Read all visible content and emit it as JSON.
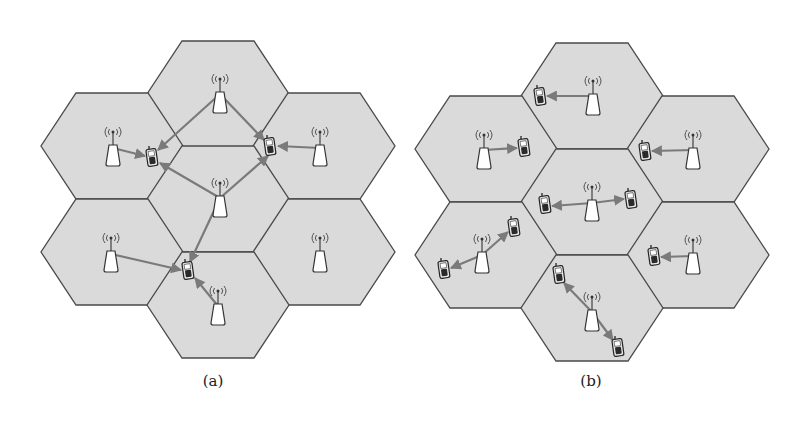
{
  "figure": {
    "colors": {
      "cell_fill": "#dadada",
      "cell_stroke": "#4a4a4a",
      "link": "#7a7a7a",
      "tower_fill": "#ffffff",
      "phone_fill": "#e8e8e8"
    },
    "hex": {
      "half_width": 71,
      "half_height": 53,
      "top_half": 36
    },
    "panels": [
      {
        "id": "a",
        "caption": "(a)",
        "caption_x": 213,
        "cells": [
          {
            "name": "top",
            "cx": 218,
            "cy": 94,
            "tower": [
              220,
              92
            ]
          },
          {
            "name": "upper-left",
            "cx": 112,
            "cy": 146,
            "tower": [
              113,
              145
            ]
          },
          {
            "name": "upper-right",
            "cx": 324,
            "cy": 146,
            "tower": [
              320,
              145
            ]
          },
          {
            "name": "center",
            "cx": 218,
            "cy": 199,
            "tower": [
              220,
              196
            ]
          },
          {
            "name": "lower-left",
            "cx": 112,
            "cy": 252,
            "tower": [
              111,
              251
            ]
          },
          {
            "name": "lower-right",
            "cx": 324,
            "cy": 252,
            "tower": [
              320,
              251
            ]
          },
          {
            "name": "bottom",
            "cx": 218,
            "cy": 305,
            "tower": [
              218,
              304
            ]
          }
        ],
        "phones": [
          {
            "name": "phone-1",
            "x": 152,
            "y": 158
          },
          {
            "name": "phone-2",
            "x": 270,
            "y": 147
          },
          {
            "name": "phone-3",
            "x": 188,
            "y": 271
          }
        ],
        "links": [
          {
            "from": [
              220,
              94
            ],
            "to": [
              158,
              150
            ]
          },
          {
            "from": [
              220,
              94
            ],
            "to": [
              264,
              140
            ]
          },
          {
            "from": [
              113,
              148
            ],
            "to": [
              145,
              156
            ]
          },
          {
            "from": [
              220,
              198
            ],
            "to": [
              160,
              163
            ]
          },
          {
            "from": [
              220,
              198
            ],
            "to": [
              268,
              156
            ]
          },
          {
            "from": [
              220,
              198
            ],
            "to": [
              190,
              262
            ]
          },
          {
            "from": [
              320,
              148
            ],
            "to": [
              278,
              146
            ]
          },
          {
            "from": [
              111,
              254
            ],
            "to": [
              181,
              270
            ]
          },
          {
            "from": [
              218,
              306
            ],
            "to": [
              195,
              278
            ]
          }
        ]
      },
      {
        "id": "b",
        "caption": "(b)",
        "caption_x": 591,
        "cells": [
          {
            "name": "top",
            "cx": 592,
            "cy": 96,
            "tower": [
              593,
              94
            ]
          },
          {
            "name": "upper-left",
            "cx": 486,
            "cy": 149,
            "tower": [
              484,
              148
            ]
          },
          {
            "name": "upper-right",
            "cx": 698,
            "cy": 149,
            "tower": [
              693,
              148
            ]
          },
          {
            "name": "center",
            "cx": 592,
            "cy": 202,
            "tower": [
              592,
              200
            ]
          },
          {
            "name": "lower-left",
            "cx": 486,
            "cy": 255,
            "tower": [
              482,
              252
            ]
          },
          {
            "name": "lower-right",
            "cx": 698,
            "cy": 255,
            "tower": [
              693,
              253
            ]
          },
          {
            "name": "bottom",
            "cx": 592,
            "cy": 308,
            "tower": [
              592,
              310
            ]
          }
        ],
        "phones": [
          {
            "name": "phone-1",
            "x": 540,
            "y": 97
          },
          {
            "name": "phone-2",
            "x": 524,
            "y": 148
          },
          {
            "name": "phone-3",
            "x": 645,
            "y": 152
          },
          {
            "name": "phone-4",
            "x": 545,
            "y": 205
          },
          {
            "name": "phone-5",
            "x": 631,
            "y": 200
          },
          {
            "name": "phone-6",
            "x": 514,
            "y": 228
          },
          {
            "name": "phone-7",
            "x": 444,
            "y": 270
          },
          {
            "name": "phone-8",
            "x": 654,
            "y": 257
          },
          {
            "name": "phone-9",
            "x": 559,
            "y": 275
          },
          {
            "name": "phone-10",
            "x": 618,
            "y": 348
          }
        ],
        "links": [
          {
            "from": [
              593,
              96
            ],
            "to": [
              547,
              96
            ]
          },
          {
            "from": [
              484,
              150
            ],
            "to": [
              517,
              148
            ]
          },
          {
            "from": [
              693,
              150
            ],
            "to": [
              652,
              151
            ]
          },
          {
            "from": [
              592,
              203
            ],
            "to": [
              552,
              206
            ]
          },
          {
            "from": [
              592,
              203
            ],
            "to": [
              624,
              199
            ]
          },
          {
            "from": [
              482,
              255
            ],
            "to": [
              508,
              232
            ]
          },
          {
            "from": [
              482,
              255
            ],
            "to": [
              451,
              268
            ]
          },
          {
            "from": [
              693,
              256
            ],
            "to": [
              661,
              257
            ]
          },
          {
            "from": [
              592,
              312
            ],
            "to": [
              564,
              283
            ]
          },
          {
            "from": [
              592,
              312
            ],
            "to": [
              613,
              340
            ]
          }
        ]
      }
    ]
  }
}
